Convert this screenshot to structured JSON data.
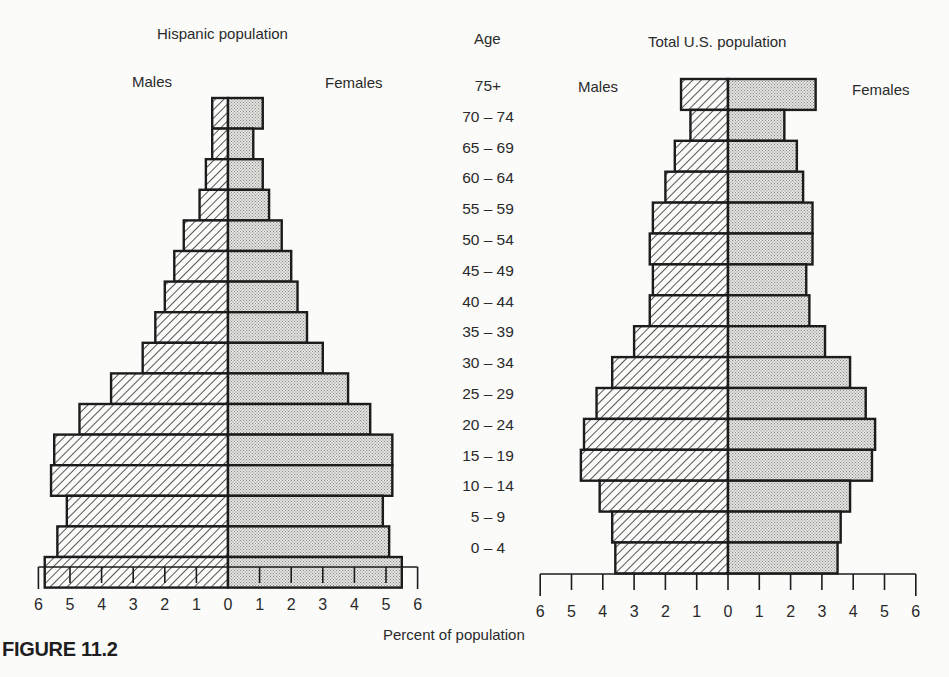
{
  "figure_caption": "FIGURE 11.2",
  "xlabel": "Percent of population",
  "age_header": "Age",
  "colors": {
    "outline": "#1c1c1c",
    "male_hatch": "#2b2b2b",
    "female_fill": "#d9d9d6",
    "background": "#fbfbfa"
  },
  "panels": [
    {
      "title": "Hispanic population",
      "left_label": "Males",
      "right_label": "Females"
    },
    {
      "title": "Total U.S. population",
      "left_label": "Males",
      "right_label": "Females"
    }
  ],
  "chart_data": {
    "type": "bar",
    "subtype": "population-pyramid",
    "title": "",
    "xlabel": "Percent of population",
    "ylabel": "Age",
    "xlim": [
      -6,
      6
    ],
    "x_ticks": [
      6,
      5,
      4,
      3,
      2,
      1,
      0,
      1,
      2,
      3,
      4,
      5,
      6
    ],
    "categories": [
      "75+",
      "70 – 74",
      "65 – 69",
      "60 – 64",
      "55 – 59",
      "50 – 54",
      "45 – 49",
      "40 – 44",
      "35 – 39",
      "30 – 34",
      "25 – 29",
      "20 – 24",
      "15 – 19",
      "10 – 14",
      "5 – 9",
      "0 – 4"
    ],
    "panels": [
      {
        "title": "Hispanic population",
        "series": [
          {
            "name": "Males",
            "pattern": "hatched",
            "values": [
              0.5,
              0.5,
              0.7,
              0.9,
              1.4,
              1.7,
              2.0,
              2.3,
              2.7,
              3.7,
              4.7,
              5.5,
              5.6,
              5.1,
              5.4,
              5.8
            ]
          },
          {
            "name": "Females",
            "pattern": "dotted",
            "values": [
              1.1,
              0.8,
              1.1,
              1.3,
              1.7,
              2.0,
              2.2,
              2.5,
              3.0,
              3.8,
              4.5,
              5.2,
              5.2,
              4.9,
              5.1,
              5.5
            ]
          }
        ]
      },
      {
        "title": "Total U.S. population",
        "series": [
          {
            "name": "Males",
            "pattern": "hatched",
            "values": [
              1.5,
              1.2,
              1.7,
              2.0,
              2.4,
              2.5,
              2.4,
              2.5,
              3.0,
              3.7,
              4.2,
              4.6,
              4.7,
              4.1,
              3.7,
              3.6
            ]
          },
          {
            "name": "Females",
            "pattern": "dotted",
            "values": [
              2.8,
              1.8,
              2.2,
              2.4,
              2.7,
              2.7,
              2.5,
              2.6,
              3.1,
              3.9,
              4.4,
              4.7,
              4.6,
              3.9,
              3.6,
              3.5
            ]
          }
        ]
      }
    ],
    "legend": {
      "left": "Males",
      "right": "Females"
    },
    "grid": false
  }
}
